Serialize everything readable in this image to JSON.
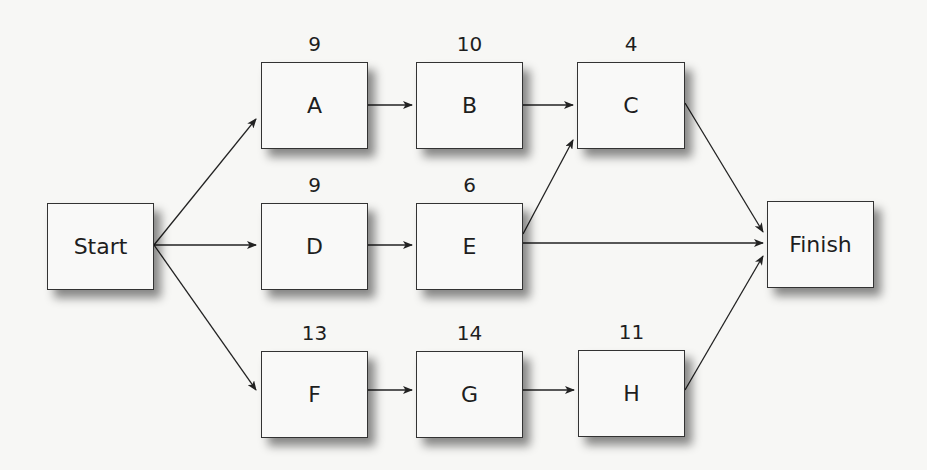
{
  "diagram": {
    "type": "activity-on-node network",
    "nodes": [
      {
        "id": "start",
        "label": "Start",
        "duration": "",
        "x": 47,
        "y": 203,
        "w": 107,
        "h": 87
      },
      {
        "id": "A",
        "label": "A",
        "duration": "9",
        "x": 261,
        "y": 62,
        "w": 107,
        "h": 87
      },
      {
        "id": "B",
        "label": "B",
        "duration": "10",
        "x": 416,
        "y": 62,
        "w": 107,
        "h": 87
      },
      {
        "id": "C",
        "label": "C",
        "duration": "4",
        "x": 577,
        "y": 62,
        "w": 108,
        "h": 87
      },
      {
        "id": "D",
        "label": "D",
        "duration": "9",
        "x": 261,
        "y": 203,
        "w": 107,
        "h": 87
      },
      {
        "id": "E",
        "label": "E",
        "duration": "6",
        "x": 416,
        "y": 203,
        "w": 107,
        "h": 87
      },
      {
        "id": "F",
        "label": "F",
        "duration": "13",
        "x": 261,
        "y": 351,
        "w": 107,
        "h": 87
      },
      {
        "id": "G",
        "label": "G",
        "duration": "14",
        "x": 416,
        "y": 351,
        "w": 107,
        "h": 87
      },
      {
        "id": "H",
        "label": "H",
        "duration": "11",
        "x": 578,
        "y": 350,
        "w": 107,
        "h": 87
      },
      {
        "id": "finish",
        "label": "Finish",
        "duration": "",
        "x": 767,
        "y": 201,
        "w": 107,
        "h": 87
      }
    ],
    "edges": [
      {
        "from": "start",
        "to": "A",
        "x1": 154,
        "y1": 245,
        "x2": 256,
        "y2": 119
      },
      {
        "from": "start",
        "to": "D",
        "x1": 154,
        "y1": 245,
        "x2": 256,
        "y2": 245
      },
      {
        "from": "start",
        "to": "F",
        "x1": 154,
        "y1": 245,
        "x2": 256,
        "y2": 390
      },
      {
        "from": "A",
        "to": "B",
        "x1": 368,
        "y1": 105,
        "x2": 412,
        "y2": 105
      },
      {
        "from": "B",
        "to": "C",
        "x1": 523,
        "y1": 105,
        "x2": 573,
        "y2": 105
      },
      {
        "from": "D",
        "to": "E",
        "x1": 368,
        "y1": 245,
        "x2": 412,
        "y2": 245
      },
      {
        "from": "E",
        "to": "C",
        "x1": 523,
        "y1": 234,
        "x2": 573,
        "y2": 140
      },
      {
        "from": "E",
        "to": "finish",
        "x1": 523,
        "y1": 243,
        "x2": 763,
        "y2": 243
      },
      {
        "from": "C",
        "to": "finish",
        "x1": 685,
        "y1": 103,
        "x2": 763,
        "y2": 232
      },
      {
        "from": "F",
        "to": "G",
        "x1": 368,
        "y1": 390,
        "x2": 412,
        "y2": 390
      },
      {
        "from": "G",
        "to": "H",
        "x1": 523,
        "y1": 390,
        "x2": 574,
        "y2": 390
      },
      {
        "from": "H",
        "to": "finish",
        "x1": 685,
        "y1": 390,
        "x2": 763,
        "y2": 256
      }
    ]
  }
}
